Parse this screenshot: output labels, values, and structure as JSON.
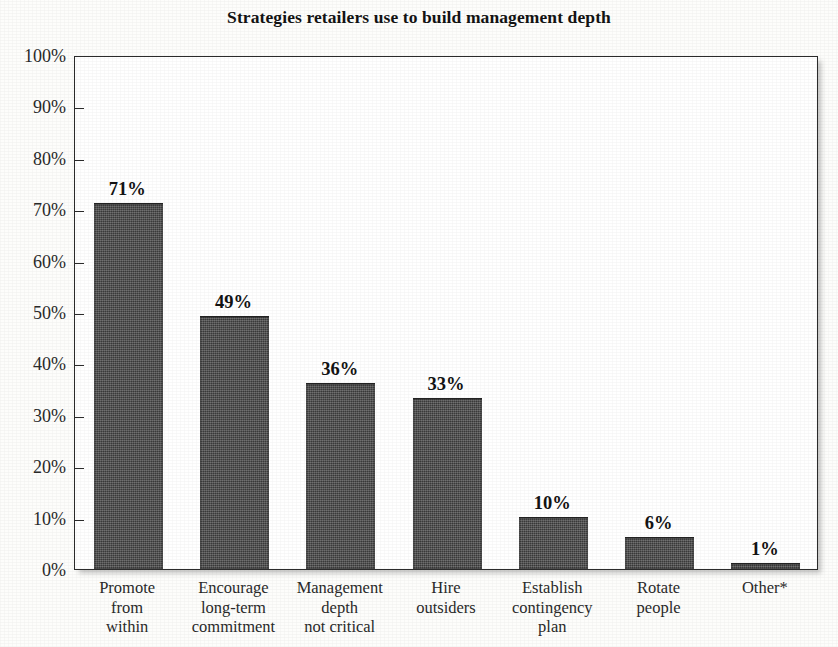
{
  "chart_data": {
    "type": "bar",
    "title": "Strategies retailers use to build management depth",
    "xlabel": "",
    "ylabel": "",
    "ylim": [
      0,
      100
    ],
    "grid": false,
    "legend": null,
    "categories": [
      "Promote from within",
      "Encourage long-term commitment",
      "Management depth not critical",
      "Hire outsiders",
      "Establish contingency plan",
      "Rotate people",
      "Other*"
    ],
    "category_lines": [
      [
        "Promote",
        "from",
        "within"
      ],
      [
        "Encourage",
        "long-term",
        "commitment"
      ],
      [
        "Management",
        "depth",
        "not critical"
      ],
      [
        "Hire",
        "outsiders"
      ],
      [
        "Establish",
        "contingency",
        "plan"
      ],
      [
        "Rotate",
        "people"
      ],
      [
        "Other*"
      ]
    ],
    "values": [
      71,
      49,
      36,
      33,
      10,
      6,
      1
    ],
    "value_labels": [
      "71%",
      "49%",
      "36%",
      "33%",
      "10%",
      "6%",
      "1%"
    ],
    "y_tick_values": [
      0,
      10,
      20,
      30,
      40,
      50,
      60,
      70,
      80,
      90,
      100
    ],
    "y_tick_labels": [
      "0%",
      "10%",
      "20%",
      "30%",
      "40%",
      "50%",
      "60%",
      "70%",
      "80%",
      "90%",
      "100%"
    ],
    "bar_color": "#4a4a4a",
    "plot_background": "#ffffff",
    "axis_color": "#2b2b2b"
  }
}
